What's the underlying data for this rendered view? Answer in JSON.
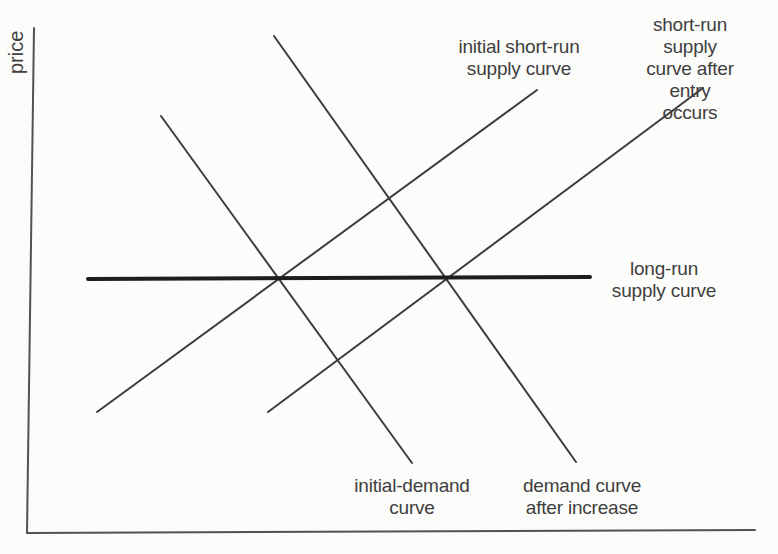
{
  "figure": {
    "width": 778,
    "height": 554
  },
  "colors": {
    "background": "#fcfcfa",
    "text": "#3e3e40",
    "axis": "#525252",
    "curve": "#3d3d3f",
    "long_run": "#1e1e1e"
  },
  "labels": {
    "price_axis": "price",
    "initial_short_run_supply": "initial short-run\nsupply curve",
    "short_run_supply_after_entry": "short-run supply\ncurve after entry\noccurs",
    "long_run_supply": "long-run\nsupply curve",
    "initial_demand": "initial-demand\ncurve",
    "demand_after_increase": "demand curve\nafter increase"
  },
  "chart_data": {
    "type": "line",
    "title": "",
    "xlabel": "",
    "ylabel": "price",
    "grid": false,
    "legend": "none",
    "coordinate_space": {
      "units": "pixels",
      "origin": "top-left",
      "width": 778,
      "height": 554
    },
    "axes": [
      {
        "id": "y-axis",
        "label": "price",
        "points": [
          [
            34,
            28
          ],
          [
            27,
            533
          ]
        ],
        "stroke": "axis",
        "stroke_width": 2
      },
      {
        "id": "x-axis",
        "label": "",
        "points": [
          [
            27,
            533
          ],
          [
            755,
            530
          ]
        ],
        "stroke": "axis",
        "stroke_width": 2
      }
    ],
    "series": [
      {
        "id": "initial-short-run-supply-curve",
        "label": "initial short-run supply curve",
        "role": "supply",
        "slope": "up",
        "points": [
          [
            97,
            412
          ],
          [
            537,
            90
          ]
        ],
        "stroke": "curve",
        "stroke_width": 2
      },
      {
        "id": "short-run-supply-curve-after-entry",
        "label": "short-run supply curve after entry occurs",
        "role": "supply",
        "slope": "up",
        "points": [
          [
            268,
            412
          ],
          [
            703,
            88
          ]
        ],
        "stroke": "curve",
        "stroke_width": 2
      },
      {
        "id": "initial-demand-curve",
        "label": "initial-demand curve",
        "role": "demand",
        "slope": "down",
        "points": [
          [
            161,
            116
          ],
          [
            412,
            463
          ]
        ],
        "stroke": "curve",
        "stroke_width": 2
      },
      {
        "id": "demand-curve-after-increase",
        "label": "demand curve after increase",
        "role": "demand",
        "slope": "down",
        "points": [
          [
            274,
            36
          ],
          [
            576,
            462
          ]
        ],
        "stroke": "curve",
        "stroke_width": 2
      },
      {
        "id": "long-run-supply-curve",
        "label": "long-run supply curve",
        "role": "supply",
        "slope": "flat",
        "points": [
          [
            88,
            279
          ],
          [
            590,
            277
          ]
        ],
        "stroke": "long_run",
        "stroke_width": 4
      }
    ],
    "intersections": [
      {
        "name": "initial-equilibrium",
        "at": [
          279,
          278
        ]
      },
      {
        "name": "new-equilibrium",
        "at": [
          447,
          278
        ]
      }
    ]
  }
}
